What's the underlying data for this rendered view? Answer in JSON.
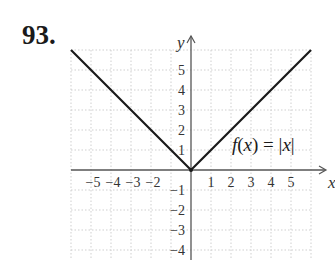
{
  "problem": {
    "number": "93."
  },
  "chart_data": {
    "type": "line",
    "title": "",
    "function_label": "f(x) = |x|",
    "xlabel": "x",
    "ylabel": "y",
    "xlim": [
      -6,
      6
    ],
    "ylim": [
      -4.4,
      6
    ],
    "grid": true,
    "x_ticks": [
      -5,
      -4,
      -3,
      -2,
      1,
      2,
      3,
      4,
      5
    ],
    "x_tick_labels": [
      "−5",
      "−4",
      "−3",
      "−2",
      "1",
      "2",
      "3",
      "4",
      "5"
    ],
    "y_ticks": [
      5,
      4,
      3,
      2,
      1,
      -1,
      -2,
      -3,
      -4
    ],
    "y_tick_labels": [
      "5",
      "4",
      "3",
      "2",
      "1",
      "−1",
      "−2",
      "−3",
      "−4"
    ],
    "series": [
      {
        "name": "f(x) = |x|",
        "x": [
          -6,
          0,
          6
        ],
        "y": [
          6,
          0,
          6
        ]
      }
    ],
    "colors": {
      "line": "#1a1a1a",
      "grid": "#cfcfcf",
      "axis": "#555555"
    }
  }
}
